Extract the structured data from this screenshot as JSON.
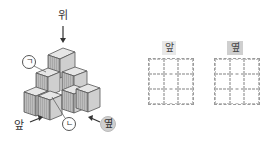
{
  "figure": {
    "labels": {
      "top": "위",
      "front": "앞",
      "side": "옆",
      "marker_a": "ㄱ",
      "marker_b": "ㄴ"
    }
  },
  "views": [
    {
      "label": "앞",
      "rows": 3,
      "cols": 3
    },
    {
      "label": "옆",
      "rows": 3,
      "cols": 3
    }
  ]
}
